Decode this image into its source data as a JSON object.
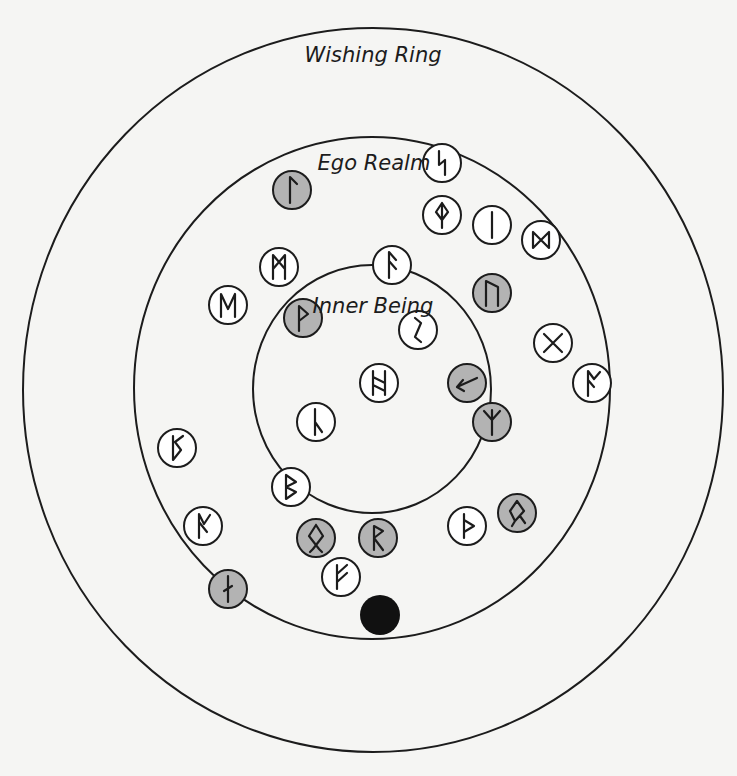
{
  "diagram": {
    "colors": {
      "background": "#f5f5f3",
      "stroke": "#1c1c1c",
      "rune_plain_fill": "#ffffff",
      "rune_shaded_fill": "#b3b3b3",
      "center_dot": "#111111"
    },
    "rings": [
      {
        "id": "wishing-ring",
        "label": "Wishing Ring",
        "cx": 373,
        "cy": 390,
        "rx": 350,
        "ry": 362,
        "label_x": 373,
        "label_y": 62
      },
      {
        "id": "ego-realm",
        "label": "Ego Realm",
        "cx": 372,
        "cy": 388,
        "rx": 238,
        "ry": 251,
        "label_x": 374,
        "label_y": 170
      },
      {
        "id": "inner-being",
        "label": "Inner Being",
        "cx": 372,
        "cy": 389,
        "rx": 119,
        "ry": 124,
        "label_x": 373,
        "label_y": 313
      }
    ],
    "rune_radius": 19,
    "runes": [
      {
        "name": "sowilo",
        "x": 442,
        "y": 163,
        "shaded": false
      },
      {
        "name": "laguz",
        "x": 292,
        "y": 190,
        "shaded": true
      },
      {
        "name": "othala-diamond",
        "x": 442,
        "y": 215,
        "shaded": false
      },
      {
        "name": "isa",
        "x": 492,
        "y": 225,
        "shaded": false
      },
      {
        "name": "dagaz",
        "x": 541,
        "y": 240,
        "shaded": false
      },
      {
        "name": "mannaz",
        "x": 279,
        "y": 267,
        "shaded": false
      },
      {
        "name": "ansuz",
        "x": 392,
        "y": 265,
        "shaded": false
      },
      {
        "name": "ehwaz",
        "x": 228,
        "y": 305,
        "shaded": false
      },
      {
        "name": "uruz",
        "x": 492,
        "y": 293,
        "shaded": true
      },
      {
        "name": "wunjo",
        "x": 303,
        "y": 318,
        "shaded": true
      },
      {
        "name": "eihwaz",
        "x": 418,
        "y": 330,
        "shaded": false
      },
      {
        "name": "gebo",
        "x": 553,
        "y": 343,
        "shaded": false
      },
      {
        "name": "hagalaz",
        "x": 379,
        "y": 383,
        "shaded": false
      },
      {
        "name": "kenaz-arrow",
        "x": 467,
        "y": 383,
        "shaded": true
      },
      {
        "name": "os",
        "x": 592,
        "y": 383,
        "shaded": false
      },
      {
        "name": "laguz-reversed",
        "x": 316,
        "y": 422,
        "shaded": false
      },
      {
        "name": "algiz",
        "x": 492,
        "y": 422,
        "shaded": true
      },
      {
        "name": "perthro",
        "x": 177,
        "y": 448,
        "shaded": false
      },
      {
        "name": "berkano",
        "x": 291,
        "y": 487,
        "shaded": false
      },
      {
        "name": "ingwaz",
        "x": 517,
        "y": 513,
        "shaded": true
      },
      {
        "name": "ear",
        "x": 203,
        "y": 526,
        "shaded": false
      },
      {
        "name": "thurisaz",
        "x": 467,
        "y": 526,
        "shaded": false
      },
      {
        "name": "othala",
        "x": 316,
        "y": 538,
        "shaded": true
      },
      {
        "name": "raido",
        "x": 378,
        "y": 538,
        "shaded": true
      },
      {
        "name": "fehu",
        "x": 341,
        "y": 577,
        "shaded": false
      },
      {
        "name": "nauthiz",
        "x": 228,
        "y": 589,
        "shaded": true
      }
    ],
    "center_dot": {
      "x": 380,
      "y": 615,
      "r": 20
    }
  }
}
